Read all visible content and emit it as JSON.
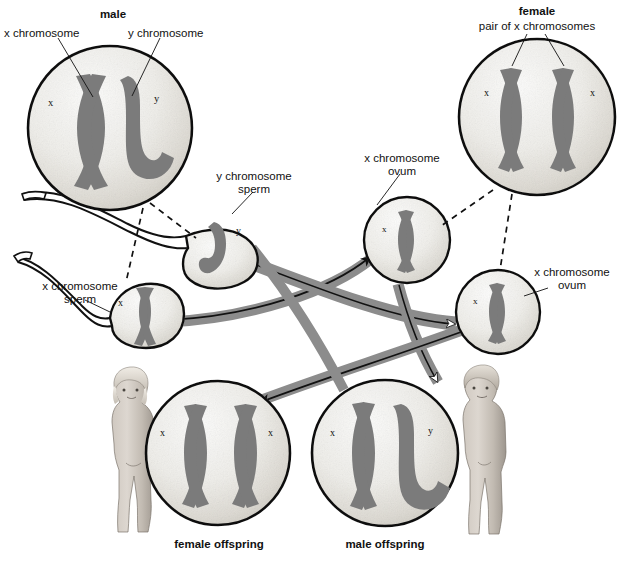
{
  "diagram": {
    "palette": {
      "chromosome": "#7b7b7b",
      "chromosome_shadow": "#5e5e5e",
      "cell_fill_light": "#f4f4f2",
      "cell_fill_mid": "#dedad4",
      "cell_outline": "#111111",
      "arrow_band": "#8c8c8c",
      "arrow_line": "#111111",
      "text": "#111111",
      "skin_light": "#d8d2cb",
      "skin_mid": "#b3aca4",
      "skin_dark": "#8a837b",
      "hair_light": "#e8e4dd",
      "hair_mid": "#bdb6ad"
    },
    "labels": {
      "male_title": "male",
      "male_x": "x chromosome",
      "male_y": "y chromosome",
      "female_title": "female",
      "female_pair": "pair of x chromosomes",
      "y_sperm": "y chromosome\nsperm",
      "y_sperm_line1": "y chromosome",
      "y_sperm_line2": "sperm",
      "x_sperm_line1": "x chromosome",
      "x_sperm_line2": "sperm",
      "ovum_upper_line1": "x chromosome",
      "ovum_upper_line2": "ovum",
      "ovum_lower_line1": "x chromosome",
      "ovum_lower_line2": "ovum",
      "female_offspring": "female offspring",
      "male_offspring": "male offspring"
    },
    "chromosome_marks": {
      "male_cell_left": "x",
      "male_cell_right": "y",
      "female_cell_left": "x",
      "female_cell_right": "x",
      "y_sperm_mark": "y",
      "x_sperm_mark": "x",
      "ovum_upper_mark": "x",
      "ovum_lower_mark": "x",
      "female_offspring_left": "x",
      "female_offspring_right": "x",
      "male_offspring_left": "x",
      "male_offspring_right": "y"
    },
    "cells": [
      {
        "id": "male-parent",
        "name": "male parent cell",
        "cx": 110,
        "cy": 128,
        "r": 82,
        "karyotype": "XY"
      },
      {
        "id": "female-parent",
        "name": "female parent cell",
        "cx": 537,
        "cy": 117,
        "r": 78,
        "karyotype": "XXXX"
      },
      {
        "id": "ovum-upper",
        "name": "x chromosome ovum",
        "cx": 407,
        "cy": 240,
        "r": 43,
        "karyotype": "X"
      },
      {
        "id": "ovum-lower",
        "name": "x chromosome ovum",
        "cx": 498,
        "cy": 312,
        "r": 42,
        "karyotype": "X"
      },
      {
        "id": "female-offspring",
        "name": "female offspring cell",
        "cx": 218,
        "cy": 453,
        "r": 72,
        "karyotype": "XX"
      },
      {
        "id": "male-offspring",
        "name": "male offspring cell",
        "cx": 385,
        "cy": 453,
        "r": 73,
        "karyotype": "XY"
      }
    ],
    "sperm": [
      {
        "id": "y-sperm",
        "name": "y chromosome sperm",
        "cx": 218,
        "cy": 250,
        "karyotype": "Y"
      },
      {
        "id": "x-sperm",
        "name": "x chromosome sperm",
        "cx": 132,
        "cy": 313,
        "karyotype": "X"
      }
    ],
    "figures": [
      {
        "id": "girl",
        "name": "female child figure",
        "sex": "female"
      },
      {
        "id": "boy",
        "name": "male child figure",
        "sex": "male"
      }
    ],
    "fertilization_paths": [
      {
        "from": "x-sperm",
        "to": "ovum-upper",
        "note": "x sperm travels to x ovum"
      },
      {
        "from": "y-sperm",
        "to": "ovum-lower",
        "note": "y sperm travels to x ovum"
      },
      {
        "from": "ovum-upper",
        "to": "male-offspring",
        "note": "x ovum + y sperm yields male offspring"
      },
      {
        "from": "ovum-lower",
        "to": "female-offspring",
        "note": "x ovum + x sperm yields female offspring"
      }
    ]
  }
}
